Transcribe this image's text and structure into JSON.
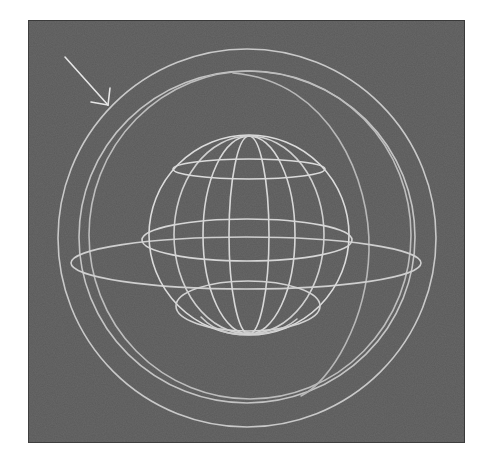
{
  "figure": {
    "alt_description": "Wireframe sphere nested inside larger concentric spheres with an arrow pointing at the outer shell",
    "background_color": "#5b5b5b",
    "line_color": "#d8d8d8",
    "line_color_dim": "#bdbdbd"
  },
  "elements": {
    "arrow": {
      "label": "arrow pointing to outer shell",
      "from": [
        64,
        56
      ],
      "to": [
        107,
        104
      ]
    },
    "outer_shell": {
      "label": "outer sphere outline",
      "center": [
        246,
        237
      ],
      "radius": 189
    },
    "inner_shell": {
      "label": "inner sphere shell",
      "center": [
        246,
        236
      ],
      "rx": 167,
      "ry": 166
    },
    "equatorial_band": {
      "label": "large equatorial ellipse",
      "center": [
        245,
        262
      ],
      "rx": 175,
      "ry": 27
    },
    "small_sphere": {
      "label": "wireframe globe",
      "center": [
        248,
        234
      ],
      "radius": 100,
      "meridian_half_widths": [
        20,
        46,
        75
      ],
      "latitude_rings": [
        {
          "name": "upper",
          "cy": 168,
          "rx": 76,
          "ry": 10
        },
        {
          "name": "equator",
          "cy": 238,
          "rx": 105,
          "ry": 22
        },
        {
          "name": "lower",
          "cy": 305,
          "rx": 72,
          "ry": 26
        }
      ]
    }
  }
}
